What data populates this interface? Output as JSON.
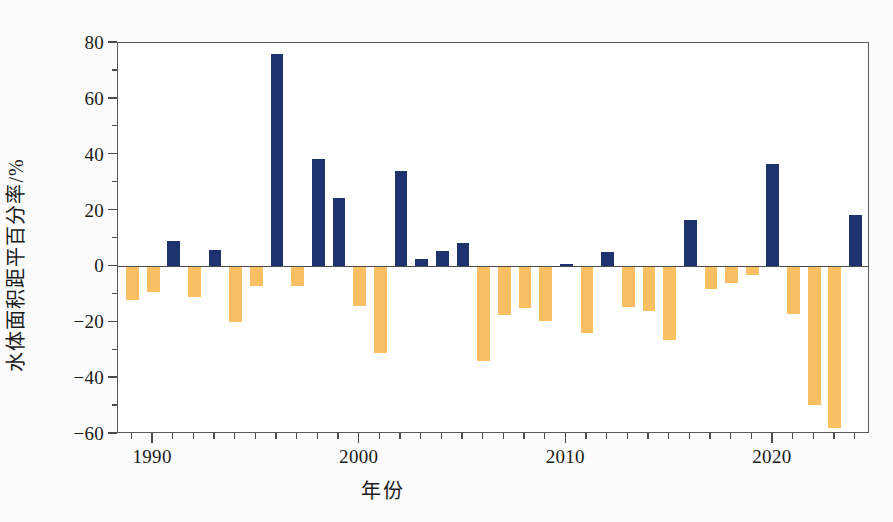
{
  "chart_data": {
    "type": "bar",
    "title": "",
    "xlabel": "年份",
    "ylabel": "水体面积距平百分率/%",
    "xlim": [
      1988.3,
      2024.7
    ],
    "ylim": [
      -60,
      80
    ],
    "grid": false,
    "legend": null,
    "y_ticks_major": [
      80,
      60,
      40,
      20,
      0,
      -20,
      -40,
      -60
    ],
    "y_ticks_minor": [
      70,
      50,
      30,
      10,
      -10,
      -30,
      -50
    ],
    "x_ticks_major": [
      1990,
      2000,
      2010,
      2020
    ],
    "x_tick_labels": [
      "1990",
      "2000",
      "2010",
      "2020"
    ],
    "x_ticks_minor": [
      1989,
      1991,
      1992,
      1993,
      1994,
      1995,
      1996,
      1997,
      1998,
      1999,
      2001,
      2002,
      2003,
      2004,
      2005,
      2006,
      2007,
      2008,
      2009,
      2011,
      2012,
      2013,
      2014,
      2015,
      2016,
      2017,
      2018,
      2019,
      2021,
      2022,
      2023,
      2024
    ],
    "positive_color": "#1F3270",
    "negative_color": "#FABE63",
    "categories": [
      1989,
      1990,
      1991,
      1992,
      1993,
      1994,
      1995,
      1996,
      1997,
      1998,
      1999,
      2000,
      2001,
      2002,
      2003,
      2004,
      2005,
      2006,
      2007,
      2008,
      2009,
      2010,
      2011,
      2012,
      2013,
      2014,
      2015,
      2016,
      2017,
      2018,
      2019,
      2020,
      2021,
      2022,
      2023,
      2024
    ],
    "values": [
      -12,
      -9,
      9,
      -11,
      6,
      -20,
      -7,
      76,
      -7,
      38.5,
      24.5,
      -14,
      -31,
      34,
      2.5,
      5.5,
      8.5,
      -34,
      -17.5,
      -15,
      -19.5,
      1,
      -24,
      5,
      -14.5,
      -16,
      -26.5,
      16.5,
      -8,
      -6,
      -3,
      36.5,
      -17,
      -49.5,
      -58,
      18.5
    ]
  }
}
